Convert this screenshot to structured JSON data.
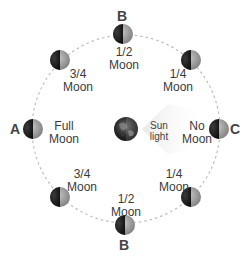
{
  "diagram": {
    "title": "",
    "orbit": {
      "cx": 126,
      "cy": 129,
      "r": 94,
      "stroke": "#bdbdbd"
    },
    "earth": {
      "cx": 126,
      "cy": 129,
      "r": 12
    },
    "sunlight": {
      "line1": "Sun",
      "line2": "light"
    },
    "moons": [
      {
        "id": "top-b",
        "cx": 123,
        "cy": 34,
        "line1": "1/2",
        "line2": "Moon"
      },
      {
        "id": "top-left",
        "cx": 60,
        "cy": 60,
        "line1": "3/4",
        "line2": "Moon"
      },
      {
        "id": "top-right",
        "cx": 191,
        "cy": 60,
        "line1": "1/4",
        "line2": "Moon"
      },
      {
        "id": "left-a",
        "cx": 33,
        "cy": 129,
        "line1": "Full",
        "line2": "Moon"
      },
      {
        "id": "right-c",
        "cx": 219,
        "cy": 129,
        "line1": "No",
        "line2": "Moon"
      },
      {
        "id": "bottom-left",
        "cx": 60,
        "cy": 197,
        "line1": "3/4",
        "line2": "Moon"
      },
      {
        "id": "bottom-right",
        "cx": 191,
        "cy": 197,
        "line1": "1/4",
        "line2": "Moon"
      },
      {
        "id": "bottom-b",
        "cx": 125,
        "cy": 225,
        "line1": "1/2",
        "line2": "Moon"
      }
    ],
    "letters": {
      "top": "B",
      "left": "A",
      "right": "C",
      "bottom": "B"
    },
    "colors": {
      "moon_dark": "#1e1e1e",
      "moon_light": "#9a9a9a",
      "orbit": "#bdbdbd",
      "text": "#3a3a3a"
    }
  }
}
